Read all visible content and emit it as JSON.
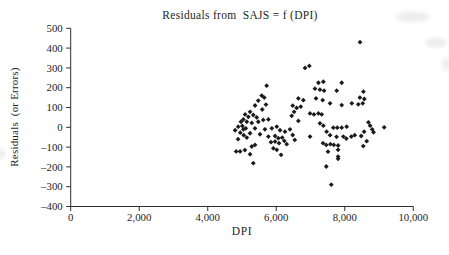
{
  "chart_data": {
    "type": "scatter",
    "title": "Residuals from  SAJS = f (DPI)",
    "xlabel": "DPI",
    "ylabel": "Residuals  (or Errors)",
    "xlim": [
      0,
      10000
    ],
    "ylim": [
      -400,
      500
    ],
    "x_tick_values": [
      0,
      2000,
      4000,
      6000,
      8000,
      10000
    ],
    "x_tick_labels": [
      "0",
      "2,000",
      "4,000",
      "6,000",
      "8,000",
      "10,000"
    ],
    "y_tick_values": [
      500,
      400,
      300,
      200,
      100,
      0,
      -100,
      -200,
      -300,
      -400
    ],
    "y_tick_labels": [
      "500",
      "400",
      "300",
      "200",
      "100",
      "0",
      "–100",
      "–200",
      "–300",
      "–400"
    ],
    "grid": false,
    "legend": null,
    "marker": {
      "shape": "diamond",
      "color": "#1a1a1a",
      "size": 4.8
    },
    "axis_color": "#2e2e2e",
    "text_color": "#1e1e1e",
    "series": [
      {
        "name": "residuals",
        "points": [
          [
            5720,
            210
          ],
          [
            5575,
            160
          ],
          [
            5650,
            150
          ],
          [
            5475,
            135
          ],
          [
            5380,
            110
          ],
          [
            5700,
            115
          ],
          [
            5590,
            90
          ],
          [
            5235,
            78
          ],
          [
            5090,
            65
          ],
          [
            5185,
            53
          ],
          [
            5330,
            62
          ],
          [
            5430,
            50
          ],
          [
            5040,
            40
          ],
          [
            4970,
            28
          ],
          [
            5140,
            28
          ],
          [
            5285,
            22
          ],
          [
            5475,
            28
          ],
          [
            5620,
            37
          ],
          [
            5770,
            40
          ],
          [
            4890,
            3
          ],
          [
            4800,
            -15
          ],
          [
            5040,
            -10
          ],
          [
            5380,
            -5
          ],
          [
            5670,
            -10
          ],
          [
            5870,
            -5
          ],
          [
            6015,
            3
          ],
          [
            6110,
            -15
          ],
          [
            5235,
            -30
          ],
          [
            5525,
            -35
          ],
          [
            6255,
            -22
          ],
          [
            6400,
            -10
          ],
          [
            5010,
            7
          ],
          [
            5110,
            -5
          ],
          [
            4950,
            -27
          ],
          [
            5050,
            -40
          ],
          [
            4885,
            -60
          ],
          [
            4830,
            -122
          ],
          [
            4945,
            -122
          ],
          [
            5085,
            -115
          ],
          [
            5140,
            -52
          ],
          [
            5770,
            -47
          ],
          [
            5965,
            -44
          ],
          [
            6060,
            -55
          ],
          [
            6175,
            -52
          ],
          [
            6235,
            -69
          ],
          [
            5965,
            -72
          ],
          [
            5845,
            -75
          ],
          [
            6080,
            -80
          ],
          [
            6305,
            -85
          ],
          [
            5285,
            -97
          ],
          [
            5380,
            -89
          ],
          [
            5915,
            -106
          ],
          [
            6015,
            -114
          ],
          [
            5235,
            -136
          ],
          [
            6140,
            -139
          ],
          [
            5330,
            -181
          ],
          [
            6840,
            300
          ],
          [
            6965,
            310
          ],
          [
            7230,
            225
          ],
          [
            7375,
            230
          ],
          [
            7910,
            225
          ],
          [
            7130,
            195
          ],
          [
            7275,
            190
          ],
          [
            7395,
            185
          ],
          [
            7765,
            185
          ],
          [
            6645,
            146
          ],
          [
            6790,
            137
          ],
          [
            7160,
            146
          ],
          [
            7355,
            137
          ],
          [
            7570,
            121
          ],
          [
            7910,
            112
          ],
          [
            8205,
            121
          ],
          [
            8395,
            116
          ],
          [
            8525,
            121
          ],
          [
            6480,
            109
          ],
          [
            6595,
            98
          ],
          [
            6715,
            104
          ],
          [
            6520,
            78
          ],
          [
            6450,
            58
          ],
          [
            6985,
            70
          ],
          [
            7100,
            65
          ],
          [
            7230,
            70
          ],
          [
            7325,
            65
          ],
          [
            6645,
            32
          ],
          [
            7275,
            20
          ],
          [
            7375,
            8
          ],
          [
            7665,
            -2
          ],
          [
            7780,
            -2
          ],
          [
            7910,
            -2
          ],
          [
            8055,
            3
          ],
          [
            7470,
            -22
          ],
          [
            7570,
            -40
          ],
          [
            7760,
            -48
          ],
          [
            6985,
            -47
          ],
          [
            6480,
            -39
          ],
          [
            8290,
            -40
          ],
          [
            8565,
            -22
          ],
          [
            6540,
            -64
          ],
          [
            7365,
            -80
          ],
          [
            7460,
            -89
          ],
          [
            7580,
            -85
          ],
          [
            7680,
            -89
          ],
          [
            7805,
            -92
          ],
          [
            7805,
            -114
          ],
          [
            7510,
            -123
          ],
          [
            7805,
            -148
          ],
          [
            7805,
            -159
          ],
          [
            7460,
            -198
          ],
          [
            7605,
            -290
          ],
          [
            7958,
            -47
          ],
          [
            8046,
            -57
          ],
          [
            8191,
            -47
          ],
          [
            8480,
            -44
          ],
          [
            8445,
            430
          ],
          [
            8545,
            180
          ],
          [
            8440,
            150
          ],
          [
            8570,
            143
          ],
          [
            8690,
            25
          ],
          [
            8740,
            8
          ],
          [
            8800,
            -10
          ],
          [
            8840,
            -25
          ],
          [
            9150,
            0
          ],
          [
            8640,
            -70
          ],
          [
            8540,
            -95
          ]
        ]
      }
    ]
  }
}
